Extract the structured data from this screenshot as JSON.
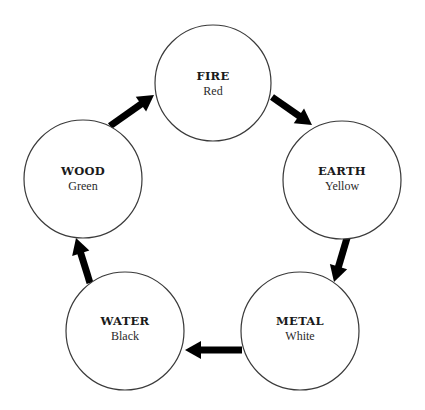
{
  "diagram": {
    "title": "",
    "nodes": [
      {
        "id": "fire",
        "title": "FIRE",
        "subtitle": "Red",
        "cx": 213,
        "cy": 83,
        "r": 58
      },
      {
        "id": "earth",
        "title": "EARTH",
        "subtitle": "Yellow",
        "cx": 342,
        "cy": 180,
        "r": 59
      },
      {
        "id": "metal",
        "title": "METAL",
        "subtitle": "White",
        "cx": 300,
        "cy": 331,
        "r": 59
      },
      {
        "id": "water",
        "title": "WATER",
        "subtitle": "Black",
        "cx": 125,
        "cy": 331,
        "r": 59
      },
      {
        "id": "wood",
        "title": "WOOD",
        "subtitle": "Green",
        "cx": 83,
        "cy": 179,
        "r": 59
      }
    ],
    "edges": [
      {
        "from": "fire",
        "to": "earth",
        "x1": 272,
        "y1": 97,
        "x2": 312,
        "y2": 125
      },
      {
        "from": "earth",
        "to": "metal",
        "x1": 347,
        "y1": 238,
        "x2": 334,
        "y2": 282
      },
      {
        "from": "metal",
        "to": "water",
        "x1": 242,
        "y1": 350,
        "x2": 185,
        "y2": 350
      },
      {
        "from": "water",
        "to": "wood",
        "x1": 90,
        "y1": 283,
        "x2": 76,
        "y2": 238
      },
      {
        "from": "wood",
        "to": "fire",
        "x1": 110,
        "y1": 126,
        "x2": 154,
        "y2": 95
      }
    ]
  }
}
